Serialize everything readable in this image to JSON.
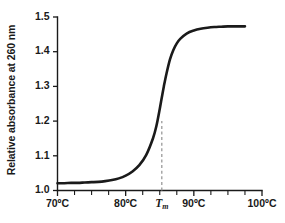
{
  "chart_data": {
    "type": "line",
    "title": "",
    "subtitle": "",
    "xlabel": "",
    "ylabel": "Relative absorbance at 260 nm",
    "xlim": [
      70,
      100
    ],
    "ylim": [
      1.0,
      1.5
    ],
    "grid": false,
    "legend": "none",
    "x_tick_labels": [
      "70ºC",
      "80ºC",
      "90ºC",
      "100ºC"
    ],
    "x_tick_values": [
      70,
      80,
      90,
      100
    ],
    "x_minor_tick_step": 2.5,
    "y_tick_labels": [
      "1.0",
      "1.1",
      "1.2",
      "1.3",
      "1.4",
      "1.5"
    ],
    "y_tick_values": [
      1.0,
      1.1,
      1.2,
      1.3,
      1.4,
      1.5
    ],
    "series": [
      {
        "name": "Relative absorbance at 260 nm",
        "color": "#1a1a1a",
        "x": [
          70,
          71,
          72,
          73,
          74,
          75,
          76,
          77,
          78,
          79,
          80,
          81,
          82,
          83,
          84,
          84.5,
          85,
          85.3,
          85.6,
          86,
          86.5,
          87,
          87.5,
          88,
          89,
          90,
          91,
          92,
          93,
          94,
          95,
          96,
          97,
          97.5
        ],
        "y": [
          1.021,
          1.021,
          1.022,
          1.022,
          1.023,
          1.024,
          1.025,
          1.027,
          1.03,
          1.035,
          1.043,
          1.055,
          1.073,
          1.102,
          1.15,
          1.185,
          1.235,
          1.268,
          1.3,
          1.338,
          1.378,
          1.405,
          1.424,
          1.437,
          1.453,
          1.461,
          1.466,
          1.469,
          1.471,
          1.472,
          1.473,
          1.473,
          1.473,
          1.473
        ]
      }
    ],
    "annotations": [
      {
        "name": "tm-marker",
        "label": "T",
        "label_subscript": "m",
        "x": 85.3,
        "y_from": 1.0,
        "y_to": 1.2,
        "style": "dashed-vertical",
        "color": "#9a9a9a"
      }
    ]
  },
  "axes": {
    "y_label_text": "Relative absorbance at 260 nm"
  }
}
